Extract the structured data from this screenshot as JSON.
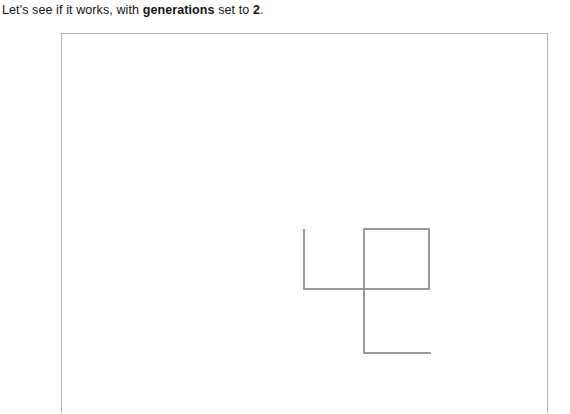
{
  "caption": {
    "segments": [
      {
        "text": "Let's see if it works, with ",
        "bold": false
      },
      {
        "text": "generations",
        "bold": true
      },
      {
        "text": " set to ",
        "bold": false
      },
      {
        "text": "2",
        "bold": true
      },
      {
        "text": ".",
        "bold": false
      }
    ],
    "full_text": "Let's see if it works, with generations set to 2.",
    "parameter_name": "generations",
    "parameter_value": "2"
  },
  "canvas": {
    "frame_color": "#b2b2b2",
    "background_color": "#ffffff",
    "stroke_color": "#9a9a9a",
    "stroke_width": 2,
    "width": 487,
    "height": 380,
    "origin_x": 61,
    "origin_y": 33
  },
  "drawing": {
    "name": "fractal-curve",
    "description": "turtle-graphics right-angle curve, generations 2",
    "points": [
      {
        "x": 242,
        "y": 195
      },
      {
        "x": 242,
        "y": 255
      },
      {
        "x": 302,
        "y": 255
      },
      {
        "x": 302,
        "y": 195
      },
      {
        "x": 367,
        "y": 195
      },
      {
        "x": 367,
        "y": 255
      },
      {
        "x": 302,
        "y": 255
      },
      {
        "x": 302,
        "y": 319
      },
      {
        "x": 369,
        "y": 319
      }
    ],
    "segments": [
      {
        "name": "segment-1",
        "x1": 242,
        "y1": 195,
        "x2": 242,
        "y2": 256
      },
      {
        "name": "segment-2",
        "x1": 241,
        "y1": 255,
        "x2": 303,
        "y2": 255
      },
      {
        "name": "segment-3",
        "x1": 302,
        "y1": 195,
        "x2": 302,
        "y2": 320
      },
      {
        "name": "segment-4",
        "x1": 301,
        "y1": 195,
        "x2": 368,
        "y2": 195
      },
      {
        "name": "segment-5",
        "x1": 367,
        "y1": 194,
        "x2": 367,
        "y2": 256
      },
      {
        "name": "segment-6",
        "x1": 368,
        "y1": 255,
        "x2": 301,
        "y2": 255
      },
      {
        "name": "segment-7",
        "x1": 301,
        "y1": 319,
        "x2": 369,
        "y2": 319
      }
    ]
  }
}
